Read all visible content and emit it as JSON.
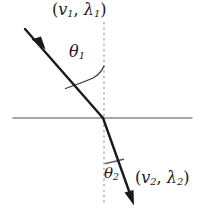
{
  "figure": {
    "kind": "refraction-diagram",
    "background_color": "#ffffff"
  },
  "labels": {
    "medium_1": {
      "name": "incident-medium-properties",
      "open_paren": "(",
      "speed_symbol": "v",
      "speed_subscript": "1",
      "comma": ", ",
      "wavelength_symbol": "λ",
      "wavelength_subscript": "1",
      "close_paren": ")",
      "full_text": "(v1, λ1)"
    },
    "medium_2": {
      "name": "refracted-medium-properties",
      "open_paren": "(",
      "speed_symbol": "v",
      "speed_subscript": "2",
      "comma": ", ",
      "wavelength_symbol": "λ",
      "wavelength_subscript": "2",
      "close_paren": ")",
      "full_text": "(v2, λ2)"
    },
    "theta_1": {
      "name": "angle-of-incidence",
      "symbol": "θ",
      "subscript": "1",
      "full_text": "θ1"
    },
    "theta_2": {
      "name": "angle-of-refraction",
      "symbol": "θ",
      "subscript": "2",
      "full_text": "θ2"
    }
  },
  "geometry": {
    "incidence_point": {
      "x": 103,
      "y": 118
    },
    "incident_ray": {
      "start": {
        "x": 25,
        "y": 29
      },
      "end": {
        "x": 103,
        "y": 118
      },
      "arrow_tip": {
        "x": 44,
        "y": 47
      },
      "color": "#1a1a1a",
      "width": 2.4
    },
    "refracted_ray": {
      "start": {
        "x": 103,
        "y": 118
      },
      "end": {
        "x": 133,
        "y": 203
      },
      "color": "#1a1a1a",
      "width": 2.4
    },
    "interface_line": {
      "x1": 13,
      "y1": 118,
      "x2": 192,
      "y2": 118,
      "color": "#8a8a8a",
      "width": 1.4
    },
    "normal_line": {
      "x1": 104,
      "y1": 22,
      "x2": 104,
      "y2": 205,
      "color": "#9a9a9a",
      "width": 1.2,
      "dash": "2,3"
    },
    "arc_theta_1": {
      "color": "#3a3a3a",
      "radius": 44
    },
    "arc_theta_2": {
      "color": "#5a5a5a",
      "radius": 44
    }
  },
  "colors": {
    "ink": "#1a1a1a",
    "interface_gray": "#8a8a8a",
    "normal_gray": "#9a9a9a",
    "background": "#ffffff"
  }
}
